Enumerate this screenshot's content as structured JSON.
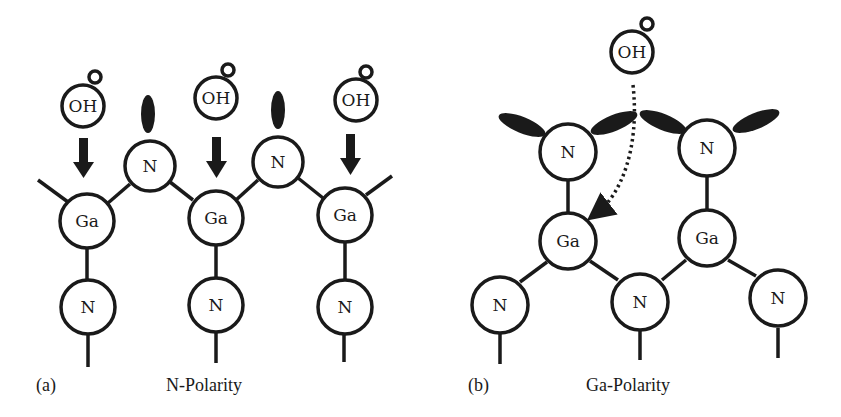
{
  "panels": [
    {
      "id": "a",
      "tag": "(a)",
      "title": "N-Polarity",
      "oh_groups": [
        {
          "label": "OH"
        },
        {
          "label": "OH"
        },
        {
          "label": "OH"
        }
      ],
      "top_atoms": [
        {
          "label": "N"
        },
        {
          "label": "N"
        }
      ],
      "mid_atoms": [
        {
          "label": "Ga"
        },
        {
          "label": "Ga"
        },
        {
          "label": "Ga"
        }
      ],
      "bottom_atoms": [
        {
          "label": "N"
        },
        {
          "label": "N"
        },
        {
          "label": "N"
        }
      ]
    },
    {
      "id": "b",
      "tag": "(b)",
      "title": "Ga-Polarity",
      "oh_groups": [
        {
          "label": "OH"
        }
      ],
      "top_atoms": [
        {
          "label": "N"
        },
        {
          "label": "N"
        }
      ],
      "mid_atoms": [
        {
          "label": "Ga"
        },
        {
          "label": "Ga"
        }
      ],
      "bottom_atoms": [
        {
          "label": "N"
        },
        {
          "label": "N"
        },
        {
          "label": "N"
        }
      ]
    }
  ],
  "colors": {
    "ink": "#1a1a1a",
    "background": "#ffffff"
  }
}
